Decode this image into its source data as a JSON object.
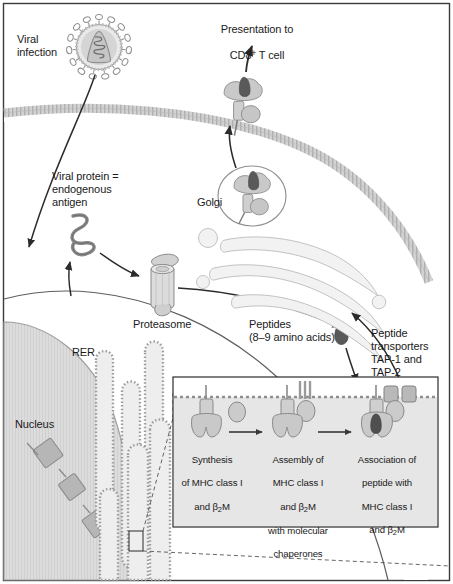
{
  "figure": {
    "frame_color": "#3b3b3b",
    "background": "#ffffff"
  },
  "colors": {
    "outline": "#6e6e6e",
    "fill_light": "#e2e2e2",
    "fill_mid": "#c9c9c9",
    "fill_dark": "#8d8d8d",
    "peptide_dark": "#555555",
    "arrow": "#2b2b2b",
    "membrane": "#c4c4c4",
    "nucleus": "#d8d8d8",
    "rer": "#b5b5b5",
    "inset_lumen": "#e4e4e4",
    "text": "#1a1a1a"
  },
  "labels": {
    "viral_infection": "Viral\ninfection",
    "presentation": {
      "line1": "Presentation to",
      "cd8_prefix": "CD8",
      "cd8_sup": "+",
      "cd8_suffix": " T cell"
    },
    "viral_protein": "Viral protein =\nendogenous\nantigen",
    "golgi": "Golgi",
    "proteasome": "Proteasome",
    "peptides": "Peptides\n(8–9 amino acids)",
    "tap": "Peptide\ntransporters\nTAP-1 and\nTAP-2",
    "rer": "RER",
    "nucleus": "Nucleus"
  },
  "inset": {
    "steps": [
      {
        "id": "synthesis",
        "line1": "Synthesis",
        "line2": "of MHC class I",
        "line3_pre": "and β",
        "line3_sub": "2",
        "line3_post": "M"
      },
      {
        "id": "assembly",
        "line1": "Assembly of",
        "line2": "MHC class I",
        "line3_pre": "and β",
        "line3_sub": "2",
        "line3_post": "M",
        "line4": "with molecular",
        "line5": "chaperones"
      },
      {
        "id": "association",
        "line1": "Association of",
        "line2": "peptide with",
        "line3": "MHC class I",
        "line4_pre": "and β",
        "line4_sub": "2",
        "line4_post": "M"
      }
    ]
  },
  "structures": {
    "virus": "virus-particle",
    "plasma_membrane": "plasma-membrane",
    "mhc_surface": "mhc-peptide-complex-surface",
    "mhc_vesicle": "mhc-peptide-complex-vesicle",
    "golgi_stack": "golgi-stack",
    "proteasome_barrel": "proteasome-barrel",
    "peptide_blob": "free-peptide",
    "nucleus_body": "nucleus",
    "chromosome_genes": "mhc-gene-loci",
    "rer_cisternae": "rough-er-cisternae",
    "tap_transporters": "tap-transporter-pair",
    "chaperones": "molecular-chaperones",
    "callout_box": "rer-magnification-callout"
  }
}
